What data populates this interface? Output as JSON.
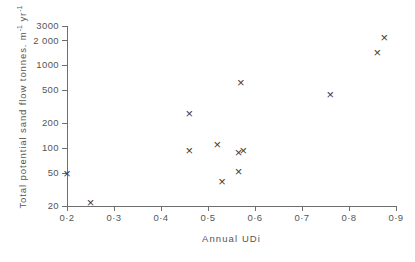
{
  "chart_data": {
    "type": "scatter",
    "title": "",
    "xlabel": "Annual  UDi",
    "ylabel": "Total  potential  sand  flow  tonnes. m⁻¹ yr⁻¹",
    "ylabel_parts": {
      "text": "Total  potential  sand  flow  tonnes. m",
      "sup1": "-1",
      "mid": " yr",
      "sup2": "-1"
    },
    "xlim": [
      0.2,
      0.9
    ],
    "ylim": [
      20,
      3000
    ],
    "yscale": "log",
    "xscale": "linear",
    "grid": false,
    "legend": false,
    "marker": "x",
    "marker_color": "#3d3d3d",
    "axis_color": "#6e6e6e",
    "xticks": [
      0.2,
      0.3,
      0.4,
      0.5,
      0.6,
      0.7,
      0.8,
      0.9
    ],
    "xtick_labels": [
      "0·2",
      "0·3",
      "0·4",
      "0·5",
      "0·6",
      "0·7",
      "0·8",
      "0·9"
    ],
    "yticks": [
      20,
      50,
      100,
      200,
      500,
      1000,
      2000,
      3000
    ],
    "ytick_labels": [
      "20",
      "50",
      "100",
      "200",
      "500",
      "1000",
      "2 000",
      "3000"
    ],
    "points": [
      {
        "x": 0.2,
        "y": 50
      },
      {
        "x": 0.25,
        "y": 22
      },
      {
        "x": 0.46,
        "y": 260
      },
      {
        "x": 0.46,
        "y": 95
      },
      {
        "x": 0.52,
        "y": 110
      },
      {
        "x": 0.53,
        "y": 40
      },
      {
        "x": 0.565,
        "y": 88
      },
      {
        "x": 0.575,
        "y": 93
      },
      {
        "x": 0.565,
        "y": 52
      },
      {
        "x": 0.57,
        "y": 620
      },
      {
        "x": 0.76,
        "y": 450
      },
      {
        "x": 0.86,
        "y": 1450
      },
      {
        "x": 0.875,
        "y": 2200
      }
    ]
  }
}
